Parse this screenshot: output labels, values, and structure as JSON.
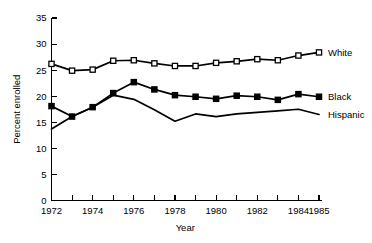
{
  "chart_data": {
    "type": "line",
    "title": "",
    "xlabel": "Year",
    "ylabel": "Percent enrolled",
    "xlim": [
      1972,
      1985
    ],
    "ylim": [
      0,
      35
    ],
    "grid": false,
    "legend_position": "right-inline",
    "x": [
      1972,
      1973,
      1974,
      1975,
      1976,
      1977,
      1978,
      1979,
      1980,
      1981,
      1982,
      1983,
      1984,
      1985
    ],
    "y_ticks": [
      0,
      5,
      10,
      15,
      20,
      25,
      30,
      35
    ],
    "y_tick_labels": [
      "0",
      "5",
      "10",
      "15",
      "20",
      "25",
      "30",
      "35"
    ],
    "x_ticks": [
      1972,
      1973,
      1974,
      1975,
      1976,
      1977,
      1978,
      1979,
      1980,
      1981,
      1982,
      1983,
      1984,
      1985
    ],
    "x_tick_labels": [
      "1972",
      "",
      "1974",
      "",
      "1976",
      "",
      "1978",
      "",
      "1980",
      "",
      "1982",
      "",
      "1984",
      "1985"
    ],
    "series": [
      {
        "name": "White",
        "marker": "open-square",
        "values": [
          26.2,
          24.9,
          25.1,
          26.8,
          26.9,
          26.3,
          25.8,
          25.8,
          26.4,
          26.7,
          27.1,
          26.9,
          27.8,
          28.4
        ]
      },
      {
        "name": "Black",
        "marker": "filled-square",
        "values": [
          18.1,
          16.1,
          17.9,
          20.6,
          22.7,
          21.3,
          20.2,
          19.9,
          19.5,
          20.1,
          19.9,
          19.3,
          20.4,
          19.9
        ]
      },
      {
        "name": "Hispanic",
        "marker": "none",
        "values": [
          13.7,
          16.1,
          17.9,
          20.2,
          19.4,
          17.4,
          15.2,
          16.6,
          16.1,
          16.6,
          16.9,
          17.2,
          17.5,
          16.5
        ]
      }
    ]
  },
  "labels": {
    "white": "White",
    "black": "Black",
    "hispanic": "Hispanic",
    "xlabel": "Year",
    "ylabel": "Percent enrolled"
  }
}
